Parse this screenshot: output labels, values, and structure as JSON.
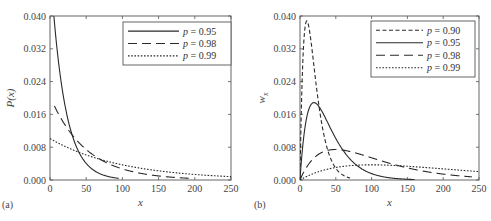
{
  "figure": {
    "panels": [
      "(a)",
      "(b)"
    ]
  },
  "chart_data": [
    {
      "type": "line",
      "panel_label": "(a)",
      "title": "",
      "xlabel": "x",
      "ylabel": "P(x)",
      "xlim": [
        0,
        250
      ],
      "ylim": [
        0.0,
        0.04
      ],
      "x_ticks": [
        "0",
        "50",
        "100",
        "150",
        "200",
        "250"
      ],
      "y_ticks": [
        "0.000",
        "0.008",
        "0.016",
        "0.024",
        "0.032",
        "0.040"
      ],
      "grid": false,
      "legend_position": "upper right",
      "formula": "P(x) = (1-p) * p^(x-1)",
      "series": [
        {
          "name": "p = 0.95",
          "p": 0.95,
          "style": "solid",
          "x_range": [
            3,
            95
          ],
          "x": [
            3,
            10,
            20,
            30,
            40,
            50,
            60,
            70,
            80,
            90,
            95
          ],
          "values": [
            0.0451,
            0.0315,
            0.0189,
            0.0113,
            0.0068,
            0.0041,
            0.0024,
            0.0015,
            0.0009,
            0.0005,
            0.0004
          ]
        },
        {
          "name": "p = 0.98",
          "p": 0.98,
          "style": "long-dash",
          "x_range": [
            6,
            195
          ],
          "x": [
            6,
            25,
            50,
            75,
            100,
            125,
            150,
            175,
            195
          ],
          "values": [
            0.0181,
            0.0124,
            0.0075,
            0.0045,
            0.0027,
            0.0016,
            0.001,
            0.0006,
            0.0004
          ]
        },
        {
          "name": "p = 0.99",
          "p": 0.99,
          "style": "dotted",
          "x_range": [
            0,
            250
          ],
          "x": [
            0,
            50,
            100,
            150,
            200,
            250
          ],
          "values": [
            0.0101,
            0.0061,
            0.0037,
            0.0022,
            0.0014,
            0.0008
          ]
        }
      ]
    },
    {
      "type": "line",
      "panel_label": "(b)",
      "title": "",
      "xlabel": "x",
      "ylabel": "w_x",
      "xlim": [
        0,
        250
      ],
      "ylim": [
        0.0,
        0.04
      ],
      "x_ticks": [
        "0",
        "50",
        "100",
        "150",
        "200",
        "250"
      ],
      "y_ticks": [
        "0.000",
        "0.008",
        "0.016",
        "0.024",
        "0.032",
        "0.040"
      ],
      "grid": false,
      "legend_position": "upper right",
      "formula": "w_x = x * (1-p)^2 * p^(x-1)",
      "series": [
        {
          "name": "p = 0.90",
          "p": 0.9,
          "style": "dashed",
          "x_range": [
            0,
            70
          ],
          "x": [
            0,
            5,
            10,
            15,
            20,
            30,
            40,
            50,
            60,
            70
          ],
          "values": [
            0.0,
            0.0328,
            0.0387,
            0.0343,
            0.027,
            0.0141,
            0.0066,
            0.0029,
            0.0012,
            0.0005
          ]
        },
        {
          "name": "p = 0.95",
          "p": 0.95,
          "style": "solid",
          "x_range": [
            0,
            160
          ],
          "x": [
            0,
            10,
            20,
            30,
            50,
            75,
            100,
            125,
            160
          ],
          "values": [
            0.0,
            0.0158,
            0.0189,
            0.017,
            0.008,
            0.0041,
            0.0015,
            0.0006,
            0.0004
          ]
        },
        {
          "name": "p = 0.98",
          "p": 0.98,
          "style": "long-dash",
          "x_range": [
            0,
            240
          ],
          "x": [
            0,
            25,
            50,
            75,
            100,
            150,
            200,
            240
          ],
          "values": [
            0.0,
            0.0062,
            0.0075,
            0.0067,
            0.0054,
            0.0029,
            0.0014,
            0.0008
          ]
        },
        {
          "name": "p = 0.99",
          "p": 0.99,
          "style": "dotted",
          "x_range": [
            0,
            250
          ],
          "x": [
            0,
            50,
            100,
            150,
            200,
            250
          ],
          "values": [
            0.0,
            0.0031,
            0.0037,
            0.0033,
            0.0027,
            0.002
          ]
        }
      ]
    }
  ],
  "colors": {
    "axis": "#555555",
    "line": "#2a2a2a",
    "background": "#ffffff"
  }
}
